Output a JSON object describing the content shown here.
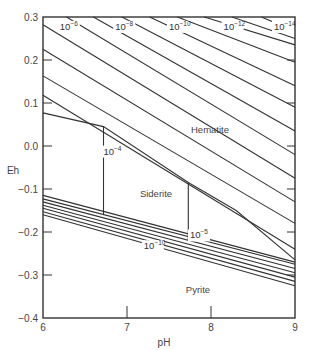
{
  "chart_data": {
    "type": "line",
    "title": "",
    "xlabel": "pH",
    "ylabel": "Eh",
    "xlim": [
      6,
      9
    ],
    "ylim": [
      -0.4,
      0.3
    ],
    "x_ticks": [
      "6",
      "7",
      "8",
      "9"
    ],
    "y_ticks": [
      "0.3",
      "0.2",
      "0.1",
      "0.0",
      "-0.1",
      "-0.2",
      "-0.3",
      "-0.4"
    ],
    "grid": false,
    "regions": [
      {
        "name": "Hematite",
        "label_pos": {
          "pH": 8.0,
          "Eh": 0.11
        }
      },
      {
        "name": "Siderite",
        "label_pos": {
          "pH": 7.3,
          "Eh": -0.11
        }
      },
      {
        "name": "Pyrite",
        "label_pos": {
          "pH": 7.8,
          "Eh": -0.33
        }
      }
    ],
    "concentration_labels": [
      {
        "base": "10",
        "exp": "−6",
        "pH": 6.2,
        "Eh": 0.27
      },
      {
        "base": "10",
        "exp": "−8",
        "pH": 6.86,
        "Eh": 0.27
      },
      {
        "base": "10",
        "exp": "−10",
        "pH": 7.5,
        "Eh": 0.27
      },
      {
        "base": "10",
        "exp": "−12",
        "pH": 8.15,
        "Eh": 0.27
      },
      {
        "base": "10",
        "exp": "−14",
        "pH": 8.75,
        "Eh": 0.27
      },
      {
        "base": "10",
        "exp": "−4",
        "pH": 6.72,
        "Eh": -0.02
      },
      {
        "base": "10",
        "exp": "−5",
        "pH": 7.75,
        "Eh": -0.215
      },
      {
        "base": "10",
        "exp": "−10",
        "pH": 7.2,
        "Eh": -0.24
      }
    ],
    "series": [
      {
        "name": "hematite-10^-4 / siderite boundary",
        "points": [
          [
            6.0,
            0.077
          ],
          [
            6.72,
            0.045
          ],
          [
            7.73,
            -0.085
          ],
          [
            8.3,
            -0.15
          ],
          [
            9.0,
            -0.265
          ]
        ]
      },
      {
        "name": "hematite contour a",
        "points": [
          [
            6.0,
            0.118
          ],
          [
            9.0,
            -0.24
          ]
        ]
      },
      {
        "name": "hematite contour b",
        "points": [
          [
            6.0,
            0.163
          ],
          [
            9.0,
            -0.18
          ]
        ]
      },
      {
        "name": "hematite contour c",
        "points": [
          [
            6.0,
            0.225
          ],
          [
            9.0,
            -0.13
          ]
        ]
      },
      {
        "name": "hematite contour 10^-6",
        "points": [
          [
            6.0,
            0.282
          ],
          [
            9.0,
            -0.075
          ]
        ]
      },
      {
        "name": "hematite contour d",
        "points": [
          [
            6.28,
            0.3
          ],
          [
            9.0,
            -0.02
          ]
        ]
      },
      {
        "name": "hematite contour 10^-8",
        "points": [
          [
            6.6,
            0.3
          ],
          [
            9.0,
            0.035
          ]
        ]
      },
      {
        "name": "hematite contour e",
        "points": [
          [
            6.94,
            0.3
          ],
          [
            9.0,
            0.09
          ]
        ]
      },
      {
        "name": "hematite contour 10^-10",
        "points": [
          [
            7.27,
            0.3
          ],
          [
            9.0,
            0.14
          ]
        ]
      },
      {
        "name": "hematite contour f",
        "points": [
          [
            7.6,
            0.3
          ],
          [
            9.0,
            0.195
          ]
        ]
      },
      {
        "name": "hematite contour 10^-12",
        "points": [
          [
            7.92,
            0.3
          ],
          [
            9.0,
            0.235
          ]
        ]
      },
      {
        "name": "hematite contour g",
        "points": [
          [
            8.25,
            0.3
          ],
          [
            9.0,
            0.25
          ]
        ]
      },
      {
        "name": "hematite contour 10^-14",
        "points": [
          [
            8.6,
            0.3
          ],
          [
            8.97,
            0.27
          ]
        ]
      },
      {
        "name": "siderite 10^-4 vertical",
        "points": [
          [
            6.72,
            0.045
          ],
          [
            6.72,
            -0.16
          ]
        ]
      },
      {
        "name": "siderite 10^-5 vertical",
        "points": [
          [
            7.73,
            -0.085
          ],
          [
            7.73,
            -0.22
          ]
        ]
      },
      {
        "name": "pyrite boundary 1",
        "points": [
          [
            6.0,
            -0.115
          ],
          [
            9.0,
            -0.27
          ]
        ]
      },
      {
        "name": "pyrite boundary 2",
        "points": [
          [
            6.0,
            -0.123
          ],
          [
            9.0,
            -0.275
          ]
        ]
      },
      {
        "name": "pyrite boundary 3",
        "points": [
          [
            6.0,
            -0.13
          ],
          [
            9.0,
            -0.285
          ]
        ]
      },
      {
        "name": "pyrite boundary 4",
        "points": [
          [
            6.0,
            -0.138
          ],
          [
            9.0,
            -0.295
          ]
        ]
      },
      {
        "name": "pyrite boundary 5",
        "points": [
          [
            6.0,
            -0.145
          ],
          [
            9.0,
            -0.305
          ]
        ]
      },
      {
        "name": "pyrite boundary 6",
        "points": [
          [
            6.0,
            -0.153
          ],
          [
            9.0,
            -0.315
          ]
        ]
      },
      {
        "name": "pyrite boundary 7 (10^-10)",
        "points": [
          [
            6.0,
            -0.16
          ],
          [
            9.0,
            -0.325
          ]
        ]
      }
    ]
  },
  "labels": {
    "xlabel": "pH",
    "ylabel": "Eh",
    "hematite": "Hematite",
    "siderite": "Siderite",
    "pyrite": "Pyrite"
  }
}
